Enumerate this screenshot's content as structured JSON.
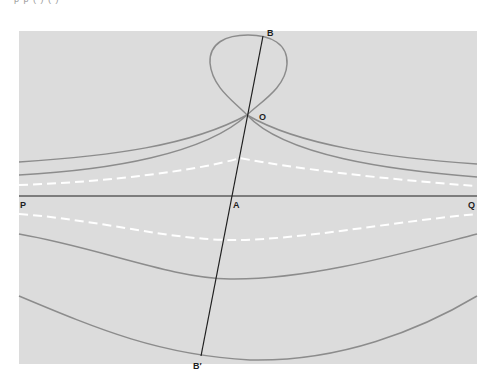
{
  "figure": {
    "top_text_fragment": "p                              p                                    (           )          (           )",
    "labels": {
      "B": "B",
      "O": "O",
      "P": "P",
      "A": "A",
      "Q": "Q",
      "B_prime": "B′"
    },
    "colors": {
      "background": "#ffffff",
      "panel": "#dcdcdc",
      "solid_curve": "#8c8c8c",
      "dashed_curve": "#ffffff",
      "straight_line": "#1e1e1e"
    },
    "elements": {
      "line_PQ": "horizontal line through P, A, Q",
      "line_BB_prime": "line through B, O, A, B′",
      "loop": "closed loop above O passing through B",
      "curves_above": [
        "solid curve 1 (through O)",
        "solid curve 2 (through O)",
        "dashed curve (above PQ)"
      ],
      "curves_below": [
        "dashed curve (below PQ)",
        "solid curve (middle)",
        "solid curve (bottom, through B′)"
      ]
    }
  }
}
